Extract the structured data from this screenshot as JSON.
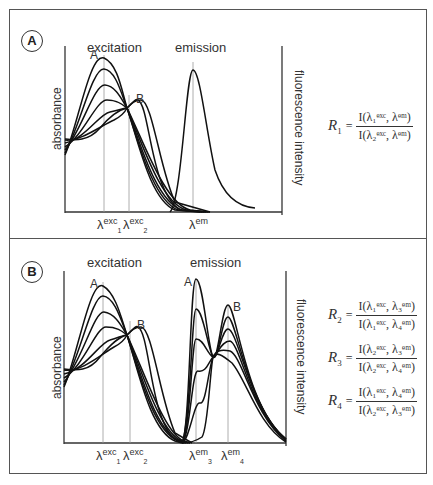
{
  "panels": [
    {
      "id": "A",
      "badge": "A",
      "headings": {
        "excitation": "excitation",
        "emission": "emission"
      },
      "axis_left": "absorbance",
      "axis_right": "fluorescence intensity",
      "curve_labels": {
        "start": "A",
        "end": "B"
      },
      "x_ticks": [
        {
          "base": "λ",
          "sup": "exc",
          "sub": "1"
        },
        {
          "base": "λ",
          "sup": "exc",
          "sub": "2"
        },
        {
          "base": "λ",
          "sup": "em",
          "sub": ""
        }
      ],
      "equations": [
        {
          "lhs": "R",
          "lhs_sub": "1",
          "num": "I(λ₁ᵉˣᶜ, λᵉᵐ)",
          "den": "I(λ₂ᵉˣᶜ, λᵉᵐ)"
        }
      ]
    },
    {
      "id": "B",
      "badge": "B",
      "headings": {
        "excitation": "excitation",
        "emission": "emission"
      },
      "axis_left": "absorbance",
      "axis_right": "fluorescence intensity",
      "curve_labels": {
        "start": "A",
        "end": "B",
        "em_start": "A",
        "em_end": "B"
      },
      "x_ticks": [
        {
          "base": "λ",
          "sup": "exc",
          "sub": "1"
        },
        {
          "base": "λ",
          "sup": "exc",
          "sub": "2"
        },
        {
          "base": "λ",
          "sup": "em",
          "sub": "3"
        },
        {
          "base": "λ",
          "sup": "em",
          "sub": "4"
        }
      ],
      "equations": [
        {
          "lhs": "R",
          "lhs_sub": "2",
          "num": "I(λ₁ᵉˣᶜ, λ₃ᵉᵐ)",
          "den": "I(λ₁ᵉˣᶜ, λ₄ᵉᵐ)"
        },
        {
          "lhs": "R",
          "lhs_sub": "3",
          "num": "I(λ₂ᵉˣᶜ, λ₃ᵉᵐ)",
          "den": "I(λ₂ᵉˣᶜ, λ₄ᵉᵐ)"
        },
        {
          "lhs": "R",
          "lhs_sub": "4",
          "num": "I(λ₁ᵉˣᶜ, λ₄ᵉᵐ)",
          "den": "I(λ₂ᵉˣᶜ, λ₃ᵉᵐ)"
        }
      ]
    }
  ],
  "eq_symbol": "="
}
